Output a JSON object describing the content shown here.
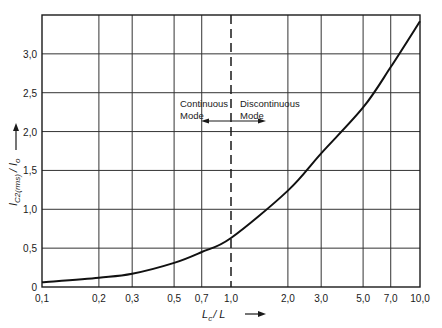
{
  "chart_data": {
    "type": "line",
    "title": "",
    "xlabel": "L_c / L",
    "ylabel": "I_C2(rms) / I_o",
    "xscale": "log",
    "xlim": [
      0.1,
      10.0
    ],
    "ylim": [
      0,
      3.5
    ],
    "grid": true,
    "x_ticks": [
      0.1,
      0.2,
      0.3,
      0.5,
      0.7,
      1.0,
      2.0,
      3.0,
      5.0,
      7.0,
      10.0
    ],
    "x_tick_labels": [
      "0,1",
      "0,2",
      "0,3",
      "0,5",
      "0,7",
      "1,0",
      "2,0",
      "3,0",
      "5,0",
      "7,0",
      "10,0"
    ],
    "y_ticks": [
      0,
      0.5,
      1.0,
      1.5,
      2.0,
      2.5,
      3.0
    ],
    "y_tick_labels": [
      "0",
      "0,5",
      "1,0",
      "1,5",
      "2,0",
      "2,5",
      "3,0"
    ],
    "series": [
      {
        "name": "I_C2(rms)/I_o",
        "x": [
          0.1,
          0.2,
          0.3,
          0.5,
          0.7,
          1.0,
          2.0,
          3.0,
          5.0,
          7.0,
          10.0
        ],
        "y": [
          0.06,
          0.12,
          0.17,
          0.31,
          0.45,
          0.63,
          1.24,
          1.72,
          2.31,
          2.83,
          3.42
        ]
      }
    ],
    "annotations": [
      {
        "type": "vline",
        "x": 1.0,
        "style": "dashed"
      },
      {
        "text_line1": "Continuous",
        "text_line2": "Mode",
        "arrow": "left",
        "side": "left of x=1.0"
      },
      {
        "text_line1": "Discontinuous",
        "text_line2": "Mode",
        "arrow": "right",
        "side": "right of x=1.0"
      }
    ]
  },
  "labels": {
    "x_axis_main": "L",
    "x_axis_sub": "c",
    "x_axis_rest": "/ L",
    "y_axis_main": "I",
    "y_axis_sub": "C2(rms)",
    "y_axis_rest": "/ I",
    "y_axis_sub2": "o",
    "continuous_1": "Continuous",
    "continuous_2": "Mode",
    "discontinuous_1": "Discontinuous",
    "discontinuous_2": "Mode"
  }
}
